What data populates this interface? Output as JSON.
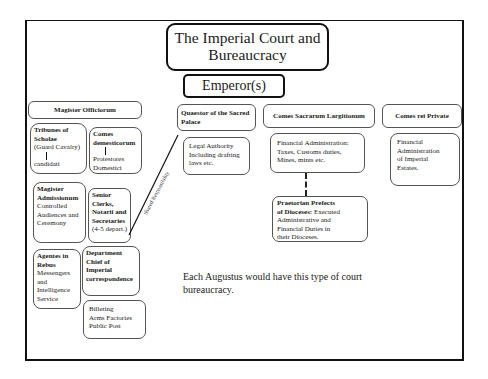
{
  "title": {
    "line1": "The Imperial Court and",
    "line2": "Bureaucracy"
  },
  "emperor": "Emperor(s)",
  "magister_officiorum": {
    "header": "Magister Officiorum",
    "tribunes": {
      "title1": "Tribunes of",
      "title2": "Scholae",
      "subtitle": "(Guard Cavalry)",
      "sub": "candidati"
    },
    "comes_domesticorum": {
      "title1": "Comes",
      "title2": "demesticorum",
      "sub1": "Protestores",
      "sub2": "Domestici"
    },
    "magister_admissionum": {
      "title1": "Magister",
      "title2": "Admissionum",
      "desc1": "Controlled",
      "desc2": "Audiences and",
      "desc3": "Ceremony"
    },
    "senior_clerks": {
      "title1": "Senior",
      "title2": "Clerks,",
      "title3": "Notarii and",
      "title4": "Secretaries",
      "desc": "(4-5 depart.)"
    },
    "agentes_in_rebus": {
      "title1": "Agentes in",
      "title2": "Rebus",
      "desc1": "Messengers",
      "desc2": "and",
      "desc3": "Intelligence",
      "desc4": "Service"
    },
    "department_chief": {
      "title1": "Department",
      "title2": "Chief of",
      "title3": "Imperial",
      "title4": "correspondence"
    },
    "billeting": {
      "line1": "Billeting",
      "line2": "Arms Factories",
      "line3": "Public Post"
    }
  },
  "shared_responsibility": "Shared Responsibility",
  "quaestor": {
    "header1": "Quaestor of the Sacred",
    "header2": "Palace",
    "desc1": "Legal Authority",
    "desc2": "Including drafting",
    "desc3": "laws etc."
  },
  "comes_sacrarum": {
    "header": "Comes Sacrarum Largitionum",
    "desc1": "Financial Administration:",
    "desc2": "Taxes, Customs duties,",
    "desc3": "Mines, mints etc."
  },
  "praetorian_prefects": {
    "title1": "Praetorian Prefects",
    "title2": "of Dioceses:",
    "desc1": " Executed",
    "desc2": "Administrative and",
    "desc3": "Financial Duties in",
    "desc4": "their Dioceses."
  },
  "comes_rei_private": {
    "header": "Comes rei Private",
    "desc1": "Financial",
    "desc2": "Administration",
    "desc3": "of Imperial",
    "desc4": "Estates."
  },
  "caption": {
    "line1": "Each Augustus would have this type of court",
    "line2": "bureaucracy."
  }
}
